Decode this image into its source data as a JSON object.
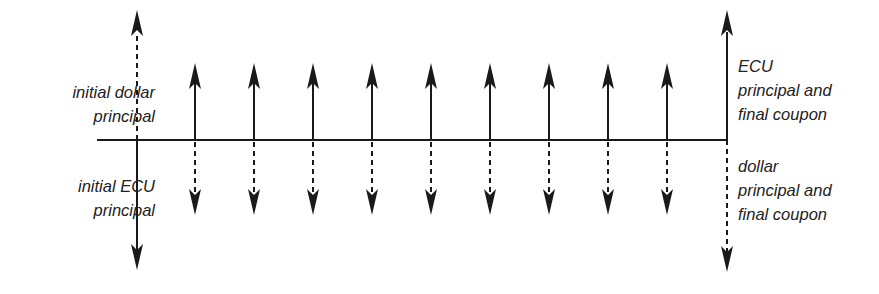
{
  "diagram": {
    "title": "",
    "type": "cash-flow timeline (currency swap)",
    "colors": {
      "line": "#1a1a1a",
      "text": "#222222",
      "background": "#ffffff"
    },
    "baseline": {
      "x_start": 97,
      "x_end": 727,
      "y": 140
    },
    "initial_flows": {
      "x": 137,
      "up": {
        "style": "dashed",
        "tip_y": 10
      },
      "down": {
        "style": "solid",
        "tip_y": 270
      }
    },
    "coupon_flows": {
      "count": 9,
      "x": [
        195,
        254,
        313,
        372,
        431,
        490,
        549,
        608,
        667
      ],
      "up": {
        "style": "solid",
        "tip_y": 63
      },
      "down": {
        "style": "dashed",
        "tip_y": 215
      }
    },
    "final_flows": {
      "x": 727,
      "up": {
        "style": "solid",
        "tip_y": 10
      },
      "down": {
        "style": "dashed",
        "tip_y": 272
      }
    },
    "labels": {
      "initial_dollar_principal": [
        "initial dollar",
        "principal"
      ],
      "initial_ecu_principal": [
        "initial ECU",
        "principal"
      ],
      "ecu_principal_final_coupon": [
        "ECU",
        "principal and",
        "final coupon"
      ],
      "dollar_principal_final_coupon": [
        "dollar",
        "principal and",
        "final coupon"
      ]
    }
  }
}
